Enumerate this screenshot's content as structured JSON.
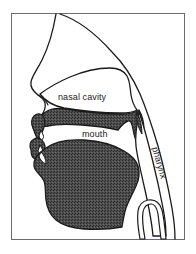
{
  "figure": {
    "background_color": "#ffffff",
    "frame": {
      "border_color": "#6b6b72",
      "border_width_px": 1,
      "x": 11,
      "y": 13,
      "width": 174,
      "height": 227
    }
  },
  "colors": {
    "outline": "#1a1a1a",
    "tissue_fill": "#4a4a4a",
    "tissue_pattern": "stipple-dither",
    "cavity_fill": "#ffffff",
    "label_color": "#1a1a1a",
    "frame_color": "#6b6b72"
  },
  "labels": [
    {
      "id": "nasal-cavity",
      "text": "nasal cavity",
      "x": 58,
      "y": 100,
      "rotation_deg": 0,
      "region": "nasal cavity"
    },
    {
      "id": "mouth",
      "text": "mouth",
      "x": 82,
      "y": 137,
      "rotation_deg": 0,
      "region": "oral cavity"
    },
    {
      "id": "pharynx",
      "text": "pharynx",
      "x": 152,
      "y": 148,
      "rotation_deg": 74,
      "region": "pharyngeal cavity"
    }
  ],
  "regions": [
    {
      "id": "head-profile",
      "name": "head profile outline",
      "shaded": false
    },
    {
      "id": "nasal-cavity-region",
      "name": "nasal cavity",
      "shaded": false
    },
    {
      "id": "hard-soft-palate",
      "name": "hard palate and velum",
      "shaded": true
    },
    {
      "id": "oral-cavity-region",
      "name": "mouth",
      "shaded": false
    },
    {
      "id": "tongue-jaw",
      "name": "tongue and lower jaw",
      "shaded": true
    },
    {
      "id": "upper-lip-teeth",
      "name": "upper lip and teeth",
      "shaded": true
    },
    {
      "id": "lower-lip-teeth",
      "name": "lower lip and teeth",
      "shaded": true
    },
    {
      "id": "pharynx-tube",
      "name": "pharynx",
      "shaded": false
    },
    {
      "id": "larynx-epiglottis",
      "name": "larynx and epiglottis",
      "shaded": false
    }
  ]
}
